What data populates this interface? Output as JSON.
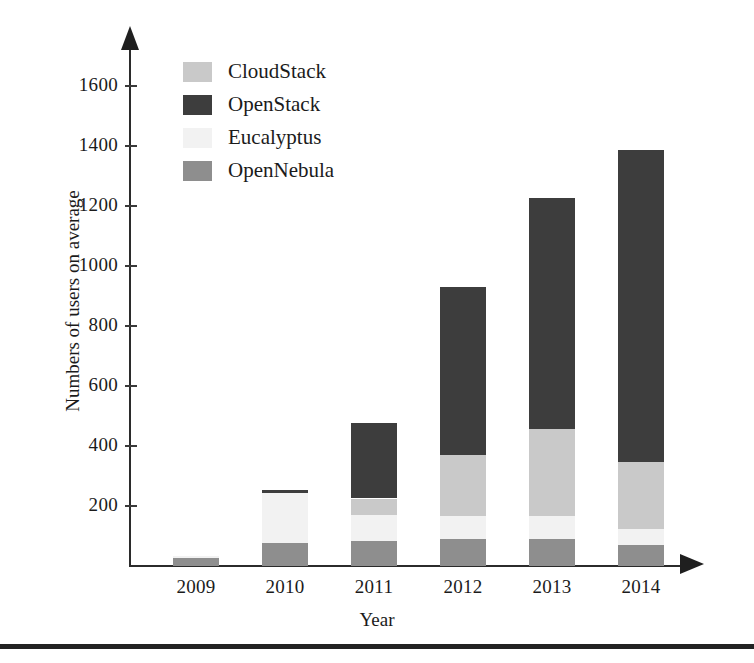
{
  "chart_data": {
    "type": "bar",
    "subtype": "stacked-vertical",
    "title": "",
    "xlabel": "Year",
    "ylabel": "Numbers of users on average",
    "categories": [
      "2009",
      "2010",
      "2011",
      "2012",
      "2013",
      "2014"
    ],
    "ylim": [
      0,
      1700
    ],
    "yticks": [
      200,
      400,
      600,
      800,
      1000,
      1200,
      1400,
      1600
    ],
    "ytick_labels": [
      "200",
      "400",
      "600",
      "800",
      "1000",
      "1200",
      "1400",
      "1600"
    ],
    "grid": false,
    "legend_position": "upper-left-inside",
    "stack_order_bottom_to_top": [
      "OpenNebula",
      "Eucalyptus",
      "CloudStack",
      "OpenStack"
    ],
    "series": [
      {
        "name": "CloudStack",
        "color": "#c9c9c9",
        "values": [
          0,
          0,
          55,
          202,
          290,
          225
        ]
      },
      {
        "name": "OpenStack",
        "color": "#3d3d3d",
        "values": [
          0,
          12,
          253,
          560,
          770,
          1040
        ]
      },
      {
        "name": "Eucalyptus",
        "color": "#f2f2f2",
        "values": [
          5,
          166,
          85,
          78,
          78,
          52
        ]
      },
      {
        "name": "OpenNebula",
        "color": "#8e8e8e",
        "values": [
          27,
          77,
          85,
          90,
          90,
          70
        ]
      }
    ],
    "totals": [
      32,
      255,
      478,
      930,
      1228,
      1387
    ]
  },
  "axes": {
    "y_title": "Numbers of users on average",
    "x_title": "Year"
  },
  "legend": {
    "items": [
      {
        "label": "CloudStack",
        "color": "#c9c9c9"
      },
      {
        "label": "OpenStack",
        "color": "#3d3d3d"
      },
      {
        "label": "Eucalyptus",
        "color": "#f2f2f2"
      },
      {
        "label": "OpenNebula",
        "color": "#8e8e8e"
      }
    ]
  },
  "colors": {
    "axis": "#2b2b2b",
    "text": "#1b1b1b",
    "background": "#ffffff"
  }
}
